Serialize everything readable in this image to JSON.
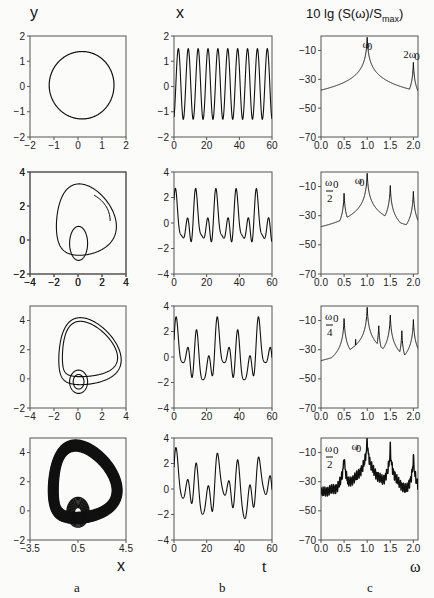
{
  "figure": {
    "column_labels": {
      "a": "a",
      "b": "b",
      "c": "c"
    },
    "axis_labels": {
      "phase_y": "y",
      "phase_x": "x",
      "time_y": "x",
      "time_x": "t",
      "spectrum_y": "10 lg (S(ω)/S",
      "spectrum_y_sub": "max",
      "spectrum_y_close": ")",
      "spectrum_x": "ω"
    }
  },
  "chart_data": [
    {
      "type": "line",
      "panel": "a1",
      "title": "",
      "xlabel": "x",
      "ylabel": "y",
      "xlim": [
        -2,
        2
      ],
      "ylim": [
        -2,
        2
      ],
      "xticks": [
        "-2",
        "-1",
        "0",
        "1",
        "2"
      ],
      "yticks": [
        "-2",
        "-1",
        "0",
        "1",
        "2"
      ],
      "description": "Limit cycle, near-circular orbit radius ~1.35"
    },
    {
      "type": "line",
      "panel": "b1",
      "xlabel": "t",
      "ylabel": "x",
      "xlim": [
        0,
        60
      ],
      "ylim": [
        -2,
        2
      ],
      "xticks": [
        "0",
        "20",
        "40",
        "60"
      ],
      "yticks": [
        "-2",
        "-1",
        "0",
        "1",
        "2"
      ],
      "description": "Periodic oscillation, ~10 periods in 0–60, amplitude -1.3..1.5"
    },
    {
      "type": "line",
      "panel": "c1",
      "xlabel": "ω",
      "ylabel": "10 lg (S(ω)/Smax)",
      "xlim": [
        0,
        2.1
      ],
      "ylim": [
        -70,
        0
      ],
      "xticks": [
        "0.0",
        "0.5",
        "1.0",
        "1.5",
        "2.0"
      ],
      "yticks": [
        "-70",
        "-50",
        "-30",
        "-10"
      ],
      "peaks": [
        {
          "x": 1.0,
          "y": 0,
          "label": "ω0"
        },
        {
          "x": 2.0,
          "y": -18,
          "label": "2ω0"
        }
      ]
    },
    {
      "type": "line",
      "panel": "a2",
      "xlabel": "x",
      "ylabel": "y",
      "xlim": [
        -4,
        4
      ],
      "ylim": [
        -2,
        4
      ],
      "xticks": [
        "-4",
        "-2",
        "0",
        "2",
        "4"
      ],
      "yticks": [
        "-2",
        "0",
        "2",
        "4"
      ],
      "description": "Period-2 cycle"
    },
    {
      "type": "line",
      "panel": "b2",
      "xlabel": "t",
      "ylabel": "x",
      "xlim": [
        0,
        60
      ],
      "ylim": [
        -4,
        4
      ],
      "xticks": [
        "0",
        "20",
        "40",
        "60"
      ],
      "yticks": [
        "-4",
        "-2",
        "0",
        "2",
        "4"
      ],
      "description": "Period-2 oscillation, peaks ~3, minima ~-2"
    },
    {
      "type": "line",
      "panel": "c2",
      "xlabel": "ω",
      "xlim": [
        0,
        2.1
      ],
      "ylim": [
        -70,
        0
      ],
      "xticks": [
        "0.0",
        "0.5",
        "1.0",
        "1.5",
        "2.0"
      ],
      "yticks": [
        "-70",
        "-50",
        "-30",
        "-10"
      ],
      "peaks": [
        {
          "x": 0.5,
          "y": -14,
          "label": "ω0/2"
        },
        {
          "x": 1.0,
          "y": 0,
          "label": "ω0"
        },
        {
          "x": 1.5,
          "y": -9
        },
        {
          "x": 2.0,
          "y": -13
        }
      ]
    },
    {
      "type": "line",
      "panel": "a3",
      "xlabel": "x",
      "ylabel": "y",
      "xlim": [
        -4,
        4
      ],
      "ylim": [
        -2,
        5
      ],
      "xticks": [
        "-4",
        "-2",
        "0",
        "2",
        "4"
      ],
      "yticks": [
        "-2",
        "0",
        "2",
        "4"
      ],
      "description": "Period-4 cycle"
    },
    {
      "type": "line",
      "panel": "b3",
      "xlabel": "t",
      "ylabel": "x",
      "xlim": [
        0,
        60
      ],
      "ylim": [
        -4,
        4
      ],
      "xticks": [
        "0",
        "20",
        "40",
        "60"
      ],
      "yticks": [
        "-4",
        "-2",
        "0",
        "2",
        "4"
      ],
      "description": "Period-4 oscillation, peaks ~3.6"
    },
    {
      "type": "line",
      "panel": "c3",
      "xlabel": "ω",
      "xlim": [
        0,
        2.1
      ],
      "ylim": [
        -70,
        0
      ],
      "xticks": [
        "0.0",
        "0.5",
        "1.0",
        "1.5",
        "2.0"
      ],
      "yticks": [
        "-70",
        "-50",
        "-30",
        "-10"
      ],
      "peaks": [
        {
          "x": 0.25,
          "y": -35,
          "label": "ω0/4"
        },
        {
          "x": 0.5,
          "y": -8
        },
        {
          "x": 0.75,
          "y": -22
        },
        {
          "x": 1.0,
          "y": 0
        },
        {
          "x": 1.25,
          "y": -13
        },
        {
          "x": 1.5,
          "y": -6
        },
        {
          "x": 1.75,
          "y": -17
        },
        {
          "x": 2.0,
          "y": -9
        }
      ]
    },
    {
      "type": "line",
      "panel": "a4",
      "xlabel": "x",
      "ylabel": "y",
      "xlim": [
        -3.5,
        4.5
      ],
      "ylim": [
        -2,
        5
      ],
      "xticks": [
        "-3.5",
        "0.5",
        "4.5"
      ],
      "yticks": [
        "-2",
        "0",
        "2",
        "4"
      ],
      "description": "Chaotic attractor"
    },
    {
      "type": "line",
      "panel": "b4",
      "xlabel": "t",
      "ylabel": "x",
      "xlim": [
        0,
        60
      ],
      "ylim": [
        -4,
        4
      ],
      "xticks": [
        "0",
        "20",
        "40",
        "60"
      ],
      "yticks": [
        "-4",
        "-2",
        "0",
        "2",
        "4"
      ],
      "description": "Chaotic oscillation"
    },
    {
      "type": "line",
      "panel": "c4",
      "xlabel": "ω",
      "xlim": [
        0,
        2.1
      ],
      "ylim": [
        -70,
        0
      ],
      "xticks": [
        "0.0",
        "0.5",
        "1.0",
        "1.5",
        "2.0"
      ],
      "yticks": [
        "-70",
        "-50",
        "-30",
        "-10"
      ],
      "peaks": [
        {
          "x": 0.5,
          "y": -11,
          "label": "ω0/2"
        },
        {
          "x": 1.0,
          "y": 0,
          "label": "ω0"
        },
        {
          "x": 1.5,
          "y": -6
        },
        {
          "x": 2.0,
          "y": -12
        }
      ],
      "description": "Broadband noisy spectrum rising from -60 to -45 with peaks"
    }
  ],
  "annotations": {
    "w0": "ω",
    "sub0": "0",
    "two": "2",
    "four": "4",
    "two_w0": "2ω"
  }
}
